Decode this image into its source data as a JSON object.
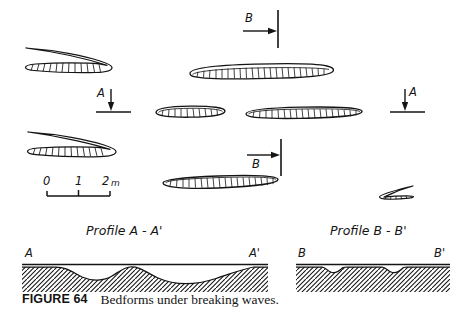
{
  "figure": {
    "caption_label": "FIGURE 64",
    "caption_text": "Bedforms under breaking waves.",
    "ink_color": "#111111",
    "background_color": "#ffffff"
  },
  "plan_view": {
    "name": "plan-view",
    "scale_bar": {
      "ticks": [
        "0",
        "1",
        "2 m"
      ],
      "unit_label": "m",
      "length_meters": 2
    },
    "section_markers": [
      {
        "id": "section-b-top",
        "label": "B",
        "direction": "right",
        "label_position": "above-arrow"
      },
      {
        "id": "section-a-left",
        "label": "A",
        "direction": "down",
        "label_position": "left-of-arrow"
      },
      {
        "id": "section-a-right",
        "label": "A",
        "direction": "down",
        "label_position": "right-of-arrow"
      },
      {
        "id": "section-b-bottom",
        "label": "B",
        "direction": "right",
        "label_position": "below-arrow"
      }
    ],
    "bedforms": [
      {
        "id": "bedform-upper-left",
        "shape": "blade",
        "hatched": true
      },
      {
        "id": "bedform-upper-center",
        "shape": "lens-long",
        "hatched": true
      },
      {
        "id": "bedform-mid-left",
        "shape": "lens-short",
        "hatched": true
      },
      {
        "id": "bedform-mid-right",
        "shape": "lens-long",
        "hatched": true
      },
      {
        "id": "bedform-lower-left",
        "shape": "blade",
        "hatched": true
      },
      {
        "id": "bedform-lower-center",
        "shape": "lens-long",
        "hatched": true
      },
      {
        "id": "bedform-lower-right",
        "shape": "blade-small",
        "hatched": true
      }
    ]
  },
  "profiles": [
    {
      "id": "profile-a",
      "title": "Profile  A - A'",
      "left_label": "A",
      "right_label": "A'",
      "description": "two broad scour hollows"
    },
    {
      "id": "profile-b",
      "title": "Profile  B - B'",
      "left_label": "B",
      "right_label": "B'",
      "description": "two small shallow depressions"
    }
  ]
}
